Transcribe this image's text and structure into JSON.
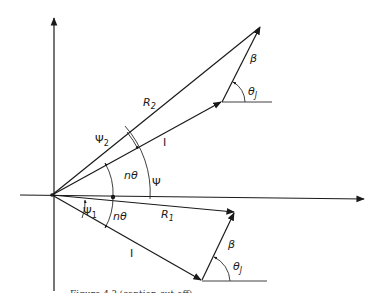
{
  "figure": {
    "labels": {
      "R2": "R",
      "R2_sub": "2",
      "R1": "R",
      "R1_sub": "1",
      "I_upper": "I",
      "I_lower": "I",
      "beta_upper": "β",
      "beta_lower": "β",
      "thetaJ_upper": "θ",
      "thetaJ_upper_sub": "J",
      "thetaJ_lower": "θ",
      "thetaJ_lower_sub": "J",
      "psi": "Ψ",
      "psi1": "Ψ",
      "psi1_sub": "1",
      "psi2": "Ψ",
      "psi2_sub": "2",
      "ntheta_upper": "nθ",
      "ntheta_lower": "nθ"
    },
    "caption": "Figure 4.?  (caption cut off)"
  },
  "colors": {
    "ink": "#1a1a1a",
    "background": "#ffffff"
  }
}
